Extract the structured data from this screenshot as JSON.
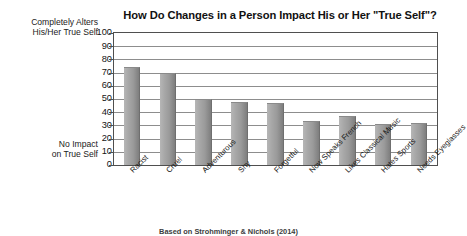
{
  "chart_data": {
    "type": "bar",
    "title": "How Do Changes in a Person Impact His or Her \"True Self\"?",
    "xlabel": "",
    "ylabel": "",
    "ylim": [
      0,
      100
    ],
    "ytick_step": 10,
    "yticks": [
      "100",
      "90",
      "80",
      "70",
      "60",
      "50",
      "40",
      "30",
      "20",
      "10",
      "0"
    ],
    "grid": true,
    "legend": "none",
    "axis_top_annotation": [
      "Completely Alters",
      "His/Her True Self"
    ],
    "axis_bottom_annotation": [
      "No Impact",
      "on True Self"
    ],
    "bar_color": "#a2a2a2",
    "categories": [
      "Racist",
      "Cruel",
      "Adventurous",
      "Shy",
      "Forgetful",
      "Now Speaks French",
      "Likes Classical Music",
      "Hates Sports",
      "Needs Eyeglasses"
    ],
    "values": [
      74,
      70,
      50,
      48,
      47,
      33,
      37,
      31,
      32
    ],
    "source": "Based on Strohminger & Nichols (2014)"
  }
}
